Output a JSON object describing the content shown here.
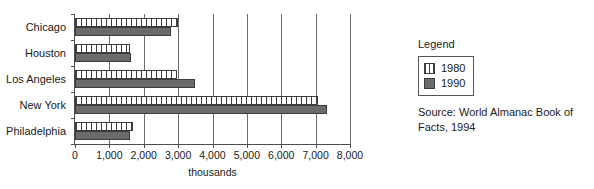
{
  "chart_data": {
    "type": "bar",
    "orientation": "horizontal",
    "title": "",
    "xlabel": "thousands",
    "ylabel": "",
    "categories": [
      "Chicago",
      "Houston",
      "Los Angeles",
      "New York",
      "Philadelphia"
    ],
    "series": [
      {
        "name": "1980",
        "values": [
          3005,
          1595,
          2970,
          7072,
          1688
        ]
      },
      {
        "name": "1990",
        "values": [
          2784,
          1630,
          3485,
          7323,
          1586
        ]
      }
    ],
    "xlim": [
      0,
      8000
    ],
    "xticks": [
      0,
      1000,
      2000,
      3000,
      4000,
      5000,
      6000,
      7000,
      8000
    ],
    "xtick_labels": [
      "0",
      "1,000",
      "2,000",
      "3,000",
      "4,000",
      "5,000",
      "6,000",
      "7,000",
      "8,000"
    ],
    "grid": "vertical",
    "legend_position": "right",
    "colors": {
      "series_1980": "#ffffff",
      "series_1980_hatch": "#3d3d3d",
      "series_1990": "#6b6b6b",
      "axis": "#4d4d4d",
      "gridline": "#6e6e6e",
      "text": "#1a1a1a"
    }
  },
  "legend": {
    "title": "Legend",
    "entries": [
      {
        "label": "1980",
        "swatch": "hatched-vertical-stripes"
      },
      {
        "label": "1990",
        "swatch": "solid-dark-gray"
      }
    ]
  },
  "source": {
    "text": "Source: World Almanac Book of Facts, 1994"
  }
}
